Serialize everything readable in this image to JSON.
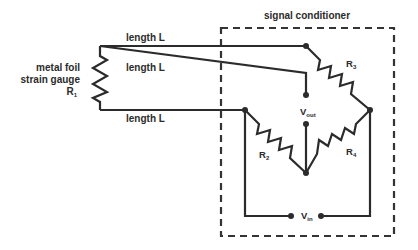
{
  "diagram": {
    "title": "signal conditioner",
    "wire_labels": [
      "length L",
      "length L",
      "length L"
    ],
    "gauge_label": {
      "line1": "metal foil",
      "line2": "strain gauge",
      "symbol": "R",
      "subscript": "1"
    },
    "resistors": [
      {
        "symbol": "R",
        "subscript": "1"
      },
      {
        "symbol": "R",
        "subscript": "2"
      },
      {
        "symbol": "R",
        "subscript": "3"
      },
      {
        "symbol": "R",
        "subscript": "4"
      }
    ],
    "vout": {
      "symbol": "V",
      "subscript": "out"
    },
    "vin": {
      "symbol": "V",
      "subscript": "in"
    },
    "colors": {
      "line": "#2b2b2b",
      "background": "#ffffff"
    }
  }
}
